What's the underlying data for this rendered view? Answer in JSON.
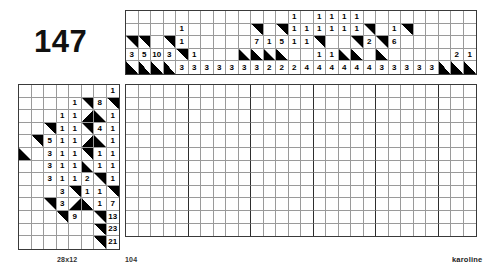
{
  "puzzle": {
    "number": "147",
    "size_label": "28x12",
    "count_label": "104",
    "author_label": "karoline",
    "ink": "#000000",
    "grid_line_color": "#9a9a9a",
    "border_color": "#3a3a3a"
  },
  "top_clues": {
    "columns": 28,
    "rows": 5,
    "cells": [
      [
        {
          "t": "",
          "f": "none"
        },
        {
          "t": "",
          "f": "none"
        },
        {
          "t": "",
          "f": "none"
        },
        {
          "t": "",
          "f": "none"
        },
        {
          "t": "",
          "f": "none"
        },
        {
          "t": "",
          "f": "none"
        },
        {
          "t": "",
          "f": "none"
        },
        {
          "t": "",
          "f": "none"
        },
        {
          "t": "",
          "f": "none"
        },
        {
          "t": "",
          "f": "none"
        },
        {
          "t": "",
          "f": "none"
        },
        {
          "t": "",
          "f": "none"
        },
        {
          "t": "",
          "f": "none"
        },
        {
          "t": "1",
          "f": "none"
        },
        {
          "t": "",
          "f": "none"
        },
        {
          "t": "1",
          "f": "none"
        },
        {
          "t": "1",
          "f": "none"
        },
        {
          "t": "1",
          "f": "none"
        },
        {
          "t": "1",
          "f": "none"
        },
        {
          "t": "",
          "f": "none"
        },
        {
          "t": "",
          "f": "none"
        },
        {
          "t": "",
          "f": "none"
        },
        {
          "t": "",
          "f": "none"
        },
        {
          "t": "",
          "f": "none"
        },
        {
          "t": "",
          "f": "none"
        },
        {
          "t": "",
          "f": "none"
        },
        {
          "t": "",
          "f": "none"
        },
        {
          "t": "",
          "f": "none"
        }
      ],
      [
        {
          "t": "",
          "f": "none"
        },
        {
          "t": "",
          "f": "none"
        },
        {
          "t": "",
          "f": "none"
        },
        {
          "t": "",
          "f": "none"
        },
        {
          "t": "1",
          "f": "none"
        },
        {
          "t": "",
          "f": "none"
        },
        {
          "t": "",
          "f": "none"
        },
        {
          "t": "",
          "f": "none"
        },
        {
          "t": "",
          "f": "none"
        },
        {
          "t": "",
          "f": "none"
        },
        {
          "t": "",
          "f": "tr"
        },
        {
          "t": "",
          "f": "none"
        },
        {
          "t": "",
          "f": "tr"
        },
        {
          "t": "1",
          "f": "none"
        },
        {
          "t": "1",
          "f": "none"
        },
        {
          "t": "1",
          "f": "none"
        },
        {
          "t": "1",
          "f": "none"
        },
        {
          "t": "1",
          "f": "none"
        },
        {
          "t": "1",
          "f": "none"
        },
        {
          "t": "",
          "f": "tr"
        },
        {
          "t": "",
          "f": "none"
        },
        {
          "t": "1",
          "f": "none"
        },
        {
          "t": "",
          "f": "tr"
        },
        {
          "t": "",
          "f": "none"
        },
        {
          "t": "",
          "f": "none"
        },
        {
          "t": "",
          "f": "none"
        },
        {
          "t": "",
          "f": "none"
        },
        {
          "t": "",
          "f": "none"
        }
      ],
      [
        {
          "t": "",
          "f": "tr"
        },
        {
          "t": "",
          "f": "tr"
        },
        {
          "t": "",
          "f": "none"
        },
        {
          "t": "",
          "f": "tr"
        },
        {
          "t": "1",
          "f": "none"
        },
        {
          "t": "",
          "f": "none"
        },
        {
          "t": "",
          "f": "none"
        },
        {
          "t": "",
          "f": "none"
        },
        {
          "t": "",
          "f": "none"
        },
        {
          "t": "",
          "f": "none"
        },
        {
          "t": "7",
          "f": "none"
        },
        {
          "t": "1",
          "f": "none"
        },
        {
          "t": "5",
          "f": "none"
        },
        {
          "t": "1",
          "f": "none"
        },
        {
          "t": "1",
          "f": "none"
        },
        {
          "t": "",
          "f": "tr"
        },
        {
          "t": "",
          "f": "none"
        },
        {
          "t": "",
          "f": "none"
        },
        {
          "t": "",
          "f": "tr"
        },
        {
          "t": "2",
          "f": "none"
        },
        {
          "t": "",
          "f": "tr"
        },
        {
          "t": "6",
          "f": "none"
        },
        {
          "t": "",
          "f": "none"
        },
        {
          "t": "",
          "f": "none"
        },
        {
          "t": "",
          "f": "none"
        },
        {
          "t": "",
          "f": "none"
        },
        {
          "t": "",
          "f": "none"
        },
        {
          "t": "",
          "f": "none"
        }
      ],
      [
        {
          "t": "3",
          "f": "none"
        },
        {
          "t": "5",
          "f": "none"
        },
        {
          "t": "10",
          "f": "none"
        },
        {
          "t": "3",
          "f": "none"
        },
        {
          "t": "",
          "f": "tr"
        },
        {
          "t": "1",
          "f": "none"
        },
        {
          "t": "",
          "f": "none"
        },
        {
          "t": "",
          "f": "none"
        },
        {
          "t": "",
          "f": "none"
        },
        {
          "t": "",
          "f": "bl"
        },
        {
          "t": "",
          "f": "bl"
        },
        {
          "t": "",
          "f": "bl"
        },
        {
          "t": "",
          "f": "bl"
        },
        {
          "t": "",
          "f": "none"
        },
        {
          "t": "",
          "f": "none"
        },
        {
          "t": "1",
          "f": "none"
        },
        {
          "t": "1",
          "f": "none"
        },
        {
          "t": "",
          "f": "bl"
        },
        {
          "t": "",
          "f": "bl"
        },
        {
          "t": "",
          "f": "none"
        },
        {
          "t": "",
          "f": "bl"
        },
        {
          "t": "",
          "f": "none"
        },
        {
          "t": "",
          "f": "none"
        },
        {
          "t": "",
          "f": "none"
        },
        {
          "t": "",
          "f": "none"
        },
        {
          "t": "",
          "f": "none"
        },
        {
          "t": "2",
          "f": "none"
        },
        {
          "t": "1",
          "f": "none"
        }
      ],
      [
        {
          "t": "",
          "f": "bl"
        },
        {
          "t": "",
          "f": "bl"
        },
        {
          "t": "",
          "f": "bl"
        },
        {
          "t": "",
          "f": "bl"
        },
        {
          "t": "3",
          "f": "none"
        },
        {
          "t": "3",
          "f": "none"
        },
        {
          "t": "3",
          "f": "none"
        },
        {
          "t": "3",
          "f": "none"
        },
        {
          "t": "3",
          "f": "none"
        },
        {
          "t": "3",
          "f": "none"
        },
        {
          "t": "3",
          "f": "none"
        },
        {
          "t": "2",
          "f": "none"
        },
        {
          "t": "2",
          "f": "none"
        },
        {
          "t": "2",
          "f": "none"
        },
        {
          "t": "4",
          "f": "none"
        },
        {
          "t": "4",
          "f": "none"
        },
        {
          "t": "4",
          "f": "none"
        },
        {
          "t": "4",
          "f": "none"
        },
        {
          "t": "4",
          "f": "none"
        },
        {
          "t": "4",
          "f": "none"
        },
        {
          "t": "3",
          "f": "none"
        },
        {
          "t": "3",
          "f": "none"
        },
        {
          "t": "3",
          "f": "none"
        },
        {
          "t": "3",
          "f": "none"
        },
        {
          "t": "3",
          "f": "none"
        },
        {
          "t": "",
          "f": "bl"
        },
        {
          "t": "",
          "f": "bl"
        },
        {
          "t": "",
          "f": "bl"
        }
      ]
    ]
  },
  "left_clues": {
    "columns": 8,
    "rows": 13,
    "cells": [
      [
        {
          "t": "",
          "f": "none"
        },
        {
          "t": "",
          "f": "none"
        },
        {
          "t": "",
          "f": "none"
        },
        {
          "t": "",
          "f": "none"
        },
        {
          "t": "",
          "f": "none"
        },
        {
          "t": "",
          "f": "none"
        },
        {
          "t": "",
          "f": "none"
        },
        {
          "t": "1",
          "f": "none"
        }
      ],
      [
        {
          "t": "",
          "f": "none"
        },
        {
          "t": "",
          "f": "none"
        },
        {
          "t": "",
          "f": "none"
        },
        {
          "t": "",
          "f": "none"
        },
        {
          "t": "1",
          "f": "none"
        },
        {
          "t": "",
          "f": "tr"
        },
        {
          "t": "8",
          "f": "none"
        },
        {
          "t": "",
          "f": "tr"
        }
      ],
      [
        {
          "t": "",
          "f": "none"
        },
        {
          "t": "",
          "f": "none"
        },
        {
          "t": "",
          "f": "none"
        },
        {
          "t": "1",
          "f": "none"
        },
        {
          "t": "1",
          "f": "none"
        },
        {
          "t": "",
          "f": "br"
        },
        {
          "t": "",
          "f": "bl"
        },
        {
          "t": "1",
          "f": "none"
        }
      ],
      [
        {
          "t": "",
          "f": "none"
        },
        {
          "t": "",
          "f": "none"
        },
        {
          "t": "",
          "f": "tr"
        },
        {
          "t": "1",
          "f": "none"
        },
        {
          "t": "1",
          "f": "none"
        },
        {
          "t": "",
          "f": "tr"
        },
        {
          "t": "4",
          "f": "none"
        },
        {
          "t": "1",
          "f": "none"
        }
      ],
      [
        {
          "t": "",
          "f": "none"
        },
        {
          "t": "",
          "f": "tr"
        },
        {
          "t": "5",
          "f": "none"
        },
        {
          "t": "1",
          "f": "none"
        },
        {
          "t": "1",
          "f": "none"
        },
        {
          "t": "",
          "f": "br"
        },
        {
          "t": "",
          "f": "bl"
        },
        {
          "t": "1",
          "f": "none"
        }
      ],
      [
        {
          "t": "",
          "f": "bl"
        },
        {
          "t": "",
          "f": "none"
        },
        {
          "t": "3",
          "f": "none"
        },
        {
          "t": "1",
          "f": "none"
        },
        {
          "t": "1",
          "f": "none"
        },
        {
          "t": "",
          "f": "tr"
        },
        {
          "t": "1",
          "f": "none"
        },
        {
          "t": "1",
          "f": "none"
        }
      ],
      [
        {
          "t": "",
          "f": "none"
        },
        {
          "t": "",
          "f": "none"
        },
        {
          "t": "3",
          "f": "none"
        },
        {
          "t": "1",
          "f": "none"
        },
        {
          "t": "1",
          "f": "none"
        },
        {
          "t": "",
          "f": "bl"
        },
        {
          "t": "1",
          "f": "none"
        },
        {
          "t": "1",
          "f": "none"
        }
      ],
      [
        {
          "t": "",
          "f": "none"
        },
        {
          "t": "",
          "f": "none"
        },
        {
          "t": "3",
          "f": "none"
        },
        {
          "t": "1",
          "f": "none"
        },
        {
          "t": "1",
          "f": "none"
        },
        {
          "t": "2",
          "f": "none"
        },
        {
          "t": "",
          "f": "tr"
        },
        {
          "t": "1",
          "f": "none"
        }
      ],
      [
        {
          "t": "",
          "f": "none"
        },
        {
          "t": "",
          "f": "none"
        },
        {
          "t": "",
          "f": "none"
        },
        {
          "t": "3",
          "f": "none"
        },
        {
          "t": "",
          "f": "tr"
        },
        {
          "t": "1",
          "f": "none"
        },
        {
          "t": "1",
          "f": "none"
        },
        {
          "t": "",
          "f": "tr"
        }
      ],
      [
        {
          "t": "",
          "f": "none"
        },
        {
          "t": "",
          "f": "none"
        },
        {
          "t": "",
          "f": "tr"
        },
        {
          "t": "3",
          "f": "none"
        },
        {
          "t": "",
          "f": "br"
        },
        {
          "t": "",
          "f": "bl"
        },
        {
          "t": "1",
          "f": "none"
        },
        {
          "t": "7",
          "f": "none"
        }
      ],
      [
        {
          "t": "",
          "f": "none"
        },
        {
          "t": "",
          "f": "none"
        },
        {
          "t": "",
          "f": "none"
        },
        {
          "t": "",
          "f": "tr"
        },
        {
          "t": "9",
          "f": "none"
        },
        {
          "t": "",
          "f": "none"
        },
        {
          "t": "",
          "f": "tr"
        },
        {
          "t": "13",
          "f": "none"
        }
      ],
      [
        {
          "t": "",
          "f": "none"
        },
        {
          "t": "",
          "f": "none"
        },
        {
          "t": "",
          "f": "none"
        },
        {
          "t": "",
          "f": "none"
        },
        {
          "t": "",
          "f": "none"
        },
        {
          "t": "",
          "f": "none"
        },
        {
          "t": "",
          "f": "tr"
        },
        {
          "t": "23",
          "f": "none"
        }
      ],
      [
        {
          "t": "",
          "f": "none"
        },
        {
          "t": "",
          "f": "none"
        },
        {
          "t": "",
          "f": "none"
        },
        {
          "t": "",
          "f": "none"
        },
        {
          "t": "",
          "f": "none"
        },
        {
          "t": "",
          "f": "none"
        },
        {
          "t": "",
          "f": "tr"
        },
        {
          "t": "21",
          "f": "none"
        }
      ]
    ]
  },
  "main_grid": {
    "columns": 28,
    "rows": 12
  }
}
